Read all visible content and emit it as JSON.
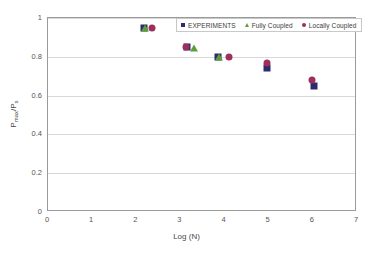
{
  "chart_data": {
    "type": "scatter",
    "title": "",
    "xlabel": "Log (N)",
    "ylabel_main": "P",
    "ylabel_sub1": "max",
    "ylabel_mid": "/P",
    "ylabel_sub2": "s",
    "ylabel_plain": "Pmax/Ps",
    "xlim": [
      0,
      7
    ],
    "ylim": [
      0,
      1
    ],
    "xticks": [
      "0",
      "1",
      "2",
      "3",
      "4",
      "5",
      "6",
      "7"
    ],
    "yticks": [
      "0",
      "0.2",
      "0.4",
      "0.6",
      "0.8",
      "1"
    ],
    "grid": "horizontal",
    "legend_position": "top-right",
    "series": [
      {
        "name": "EXPERIMENTS",
        "marker": "square",
        "color": "#2d2a6e",
        "points": [
          {
            "x": 2.18,
            "y": 0.948
          },
          {
            "x": 3.14,
            "y": 0.848
          },
          {
            "x": 3.86,
            "y": 0.798
          },
          {
            "x": 4.96,
            "y": 0.742
          },
          {
            "x": 6.02,
            "y": 0.65
          }
        ]
      },
      {
        "name": "Fully Coupled",
        "marker": "triangle",
        "color": "#5d9e3a",
        "points": [
          {
            "x": 2.2,
            "y": 0.946
          },
          {
            "x": 3.3,
            "y": 0.845
          },
          {
            "x": 3.88,
            "y": 0.797
          }
        ]
      },
      {
        "name": "Locally Coupled",
        "marker": "circle",
        "color": "#9e2f5c",
        "points": [
          {
            "x": 2.35,
            "y": 0.948
          },
          {
            "x": 3.12,
            "y": 0.852
          },
          {
            "x": 4.1,
            "y": 0.8
          },
          {
            "x": 4.95,
            "y": 0.77
          },
          {
            "x": 5.98,
            "y": 0.68
          }
        ]
      }
    ]
  }
}
